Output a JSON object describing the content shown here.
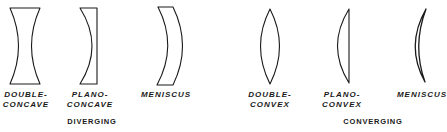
{
  "diagram": {
    "stroke_color": "#1a1a1a",
    "groups": [
      {
        "label": "DIVERGING",
        "lenses": [
          {
            "type": "double-concave",
            "label_line1": "DOUBLE-",
            "label_line2": "CONCAVE"
          },
          {
            "type": "plano-concave",
            "label_line1": "PLANO-",
            "label_line2": "CONCAVE"
          },
          {
            "type": "meniscus-diverging",
            "label_line1": "MENISCUS",
            "label_line2": ""
          }
        ]
      },
      {
        "label": "CONVERGING",
        "lenses": [
          {
            "type": "double-convex",
            "label_line1": "DOUBLE-",
            "label_line2": "CONVEX"
          },
          {
            "type": "plano-convex",
            "label_line1": "PLANO-",
            "label_line2": "CONVEX"
          },
          {
            "type": "meniscus-converging",
            "label_line1": "MENISCUS",
            "label_line2": ""
          }
        ]
      }
    ]
  }
}
